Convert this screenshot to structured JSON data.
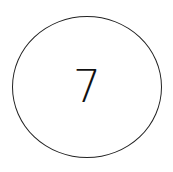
{
  "node": {
    "label": "7",
    "shape": "circle",
    "stroke_color": "#222222",
    "fill_color": "#ffffff",
    "text_color": "#111111"
  }
}
